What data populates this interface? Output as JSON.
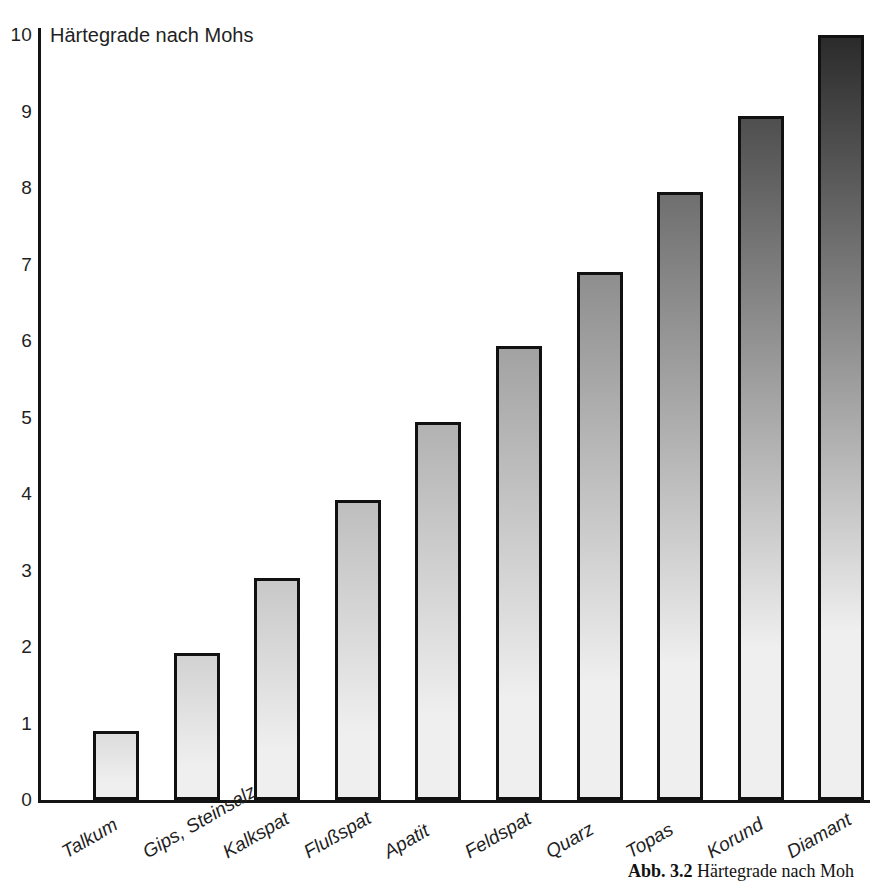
{
  "figure": {
    "caption_number": "Abb. 3.2",
    "caption_text": "Härtegrade nach Moh"
  },
  "chart_data": {
    "type": "bar",
    "title": "Härtegrade nach Mohs",
    "xlabel": "",
    "ylabel": "",
    "ylim": [
      0,
      10
    ],
    "grid": false,
    "legend": null,
    "categories": [
      "Talkum",
      "Gips, Steinsalz",
      "Kalkspat",
      "Flußspat",
      "Apatit",
      "Feldspat",
      "Quarz",
      "Topas",
      "Korund",
      "Diamant"
    ],
    "values": [
      1,
      2,
      3,
      4,
      5,
      6,
      7,
      8,
      9,
      10
    ],
    "drawn_values": [
      0.9,
      1.92,
      2.9,
      3.92,
      4.94,
      5.93,
      6.9,
      7.95,
      8.94,
      10.0
    ],
    "ytick_labels": [
      "0",
      "1",
      "2",
      "3",
      "4",
      "5",
      "6",
      "7",
      "8",
      "9",
      "10"
    ],
    "bar_top_colors": [
      "#dcdcdc",
      "#d2d2d2",
      "#c8c8c8",
      "#bebebe",
      "#b2b2b2",
      "#a2a2a2",
      "#8e8e8e",
      "#6f6f6f",
      "#4f4f4f",
      "#2b2b2b"
    ],
    "bar_bottom_color": "#efefef",
    "bar_outline_color": "#111111"
  }
}
